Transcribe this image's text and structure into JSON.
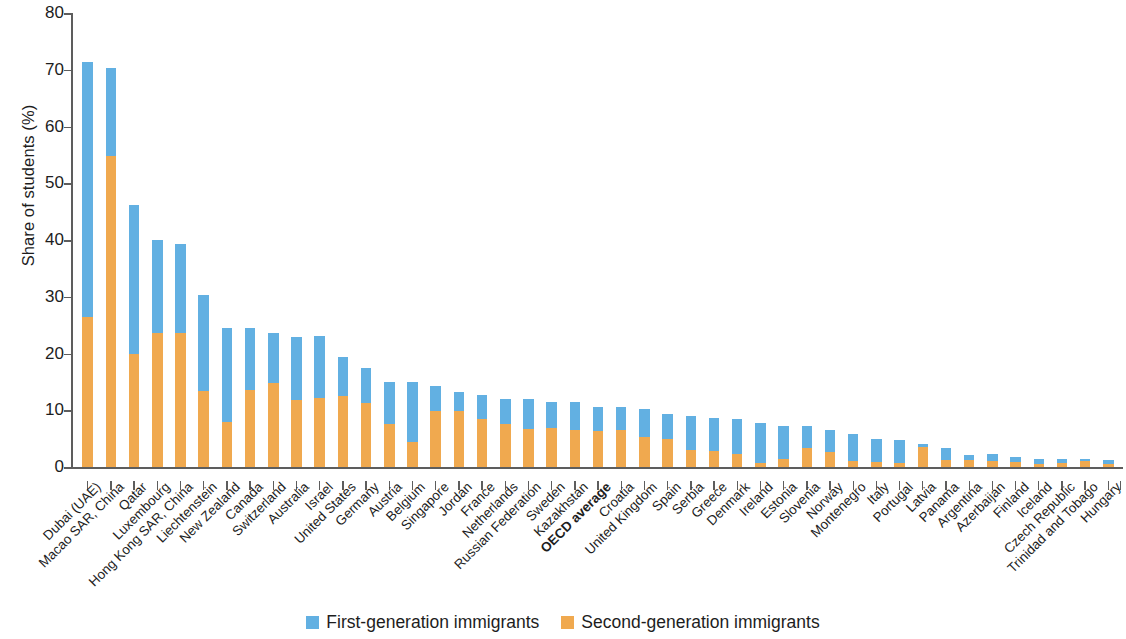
{
  "chart_data": {
    "type": "bar",
    "subtype": "stacked-vertical",
    "title": "",
    "xlabel": "",
    "ylabel": "Share of students (%)",
    "ylim": [
      0,
      80
    ],
    "yticks": [
      0,
      10,
      20,
      30,
      40,
      50,
      60,
      70,
      80
    ],
    "grid": false,
    "legend_position": "bottom-center",
    "colors": {
      "first_generation": "#62b0e2",
      "second_generation": "#f0a94f",
      "axis": "#5d5d5d",
      "text": "#1d1d1d",
      "background": "#ffffff"
    },
    "legend": [
      {
        "name": "First-generation immigrants",
        "color": "#62b0e2"
      },
      {
        "name": "Second-generation immigrants",
        "color": "#f0a94f"
      }
    ],
    "categories": [
      "Dubai (UAE)",
      "Macao SAR, China",
      "Qatar",
      "Luxembourg",
      "Hong Kong SAR, China",
      "Liechtenstein",
      "New Zealand",
      "Canada",
      "Switzerland",
      "Australia",
      "Israel",
      "United States",
      "Germany",
      "Austria",
      "Belgium",
      "Singapore",
      "Jordan",
      "France",
      "Netherlands",
      "Russian Federation",
      "Sweden",
      "Kazakhstan",
      "OECD average",
      "Croatia",
      "United Kingdom",
      "Spain",
      "Serbia",
      "Greece",
      "Denmark",
      "Ireland",
      "Estonia",
      "Slovenia",
      "Norway",
      "Montenegro",
      "Italy",
      "Portugal",
      "Latvia",
      "Panama",
      "Argentina",
      "Azerbaijan",
      "Finland",
      "Iceland",
      "Czech Republic",
      "Trinidad and Tobago",
      "Hungary"
    ],
    "emphasized_categories": [
      "OECD average"
    ],
    "series": [
      {
        "name": "Second-generation immigrants",
        "color": "#f0a94f",
        "values": [
          26.4,
          54.8,
          19.9,
          23.6,
          23.6,
          13.4,
          7.9,
          13.5,
          14.8,
          11.8,
          12.2,
          12.5,
          11.3,
          7.6,
          4.4,
          9.9,
          9.9,
          8.4,
          7.6,
          6.7,
          6.8,
          6.5,
          6.4,
          6.6,
          5.3,
          4.9,
          3.0,
          2.8,
          2.3,
          0.7,
          1.5,
          3.3,
          2.7,
          1.0,
          0.8,
          0.7,
          3.6,
          1.2,
          1.3,
          1.0,
          0.9,
          0.6,
          0.7,
          1.0,
          0.5
        ]
      },
      {
        "name": "First-generation immigrants",
        "color": "#62b0e2",
        "values": [
          45.0,
          15.6,
          26.3,
          16.4,
          15.7,
          16.9,
          16.6,
          11.0,
          8.8,
          11.2,
          10.8,
          6.9,
          6.1,
          7.4,
          10.6,
          4.3,
          3.3,
          4.3,
          4.3,
          5.2,
          4.7,
          5.0,
          4.2,
          4.0,
          5.0,
          4.4,
          6.0,
          5.8,
          6.1,
          7.1,
          5.7,
          3.9,
          3.8,
          4.9,
          4.2,
          4.1,
          0.4,
          2.2,
          0.8,
          1.3,
          0.8,
          0.9,
          0.7,
          0.4,
          0.7
        ]
      }
    ],
    "totals": [
      71.4,
      70.4,
      46.2,
      40.0,
      39.3,
      30.3,
      24.5,
      24.5,
      23.6,
      23.0,
      19.5,
      19.4,
      17.4,
      15.0,
      15.0,
      14.2,
      13.2,
      12.7,
      11.9,
      11.9,
      11.5,
      11.5,
      10.6,
      10.6,
      10.3,
      9.3,
      9.0,
      8.6,
      8.4,
      7.8,
      7.2,
      7.2,
      6.5,
      5.9,
      5.0,
      4.8,
      4.0,
      3.4,
      2.1,
      2.3,
      1.7,
      1.5,
      1.4,
      1.4,
      1.2
    ]
  }
}
